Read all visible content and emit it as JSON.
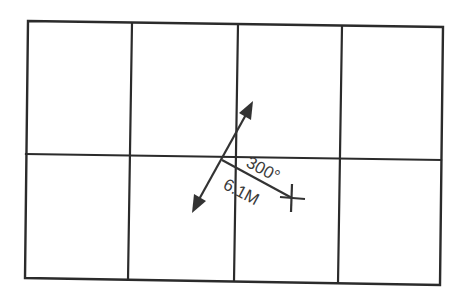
{
  "diagram": {
    "type": "plotting-grid-with-bearing",
    "grid": {
      "columns": 4,
      "rows": 2,
      "corners": {
        "top_left": [
          28,
          21
        ],
        "top_right": [
          443,
          27
        ],
        "bottom_right": [
          440,
          285
        ],
        "bottom_left": [
          25,
          278
        ]
      },
      "vertical_lines": [
        {
          "top": [
            132,
            23
          ],
          "bottom": [
            128,
            280
          ]
        },
        {
          "top": [
            238,
            24
          ],
          "bottom": [
            234,
            281
          ]
        },
        {
          "top": [
            342,
            26
          ],
          "bottom": [
            338,
            283
          ]
        }
      ],
      "horizontal_line": {
        "left": [
          26,
          154
        ],
        "right": [
          441,
          160
        ]
      },
      "line_color": "#2b2b2b"
    },
    "course_vector": {
      "start_arrow_tip": [
        192,
        213
      ],
      "end_arrow_tip": [
        253,
        101
      ],
      "double_headed": true,
      "color": "#333333"
    },
    "bearing_line": {
      "origin": [
        222,
        160
      ],
      "end": [
        292,
        198
      ],
      "color": "#333333"
    },
    "target_marker": {
      "symbol": "cross",
      "center": [
        292,
        198
      ]
    },
    "labels": {
      "bearing": "300°",
      "distance": "6.1M"
    }
  }
}
